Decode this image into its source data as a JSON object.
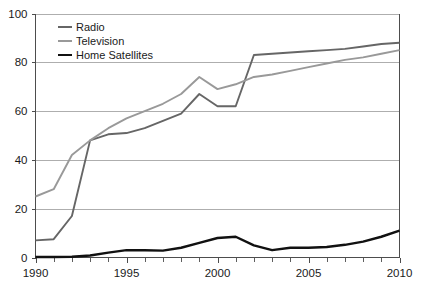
{
  "chart_data": {
    "type": "line",
    "title": "",
    "subtitle": "",
    "xlabel": "",
    "ylabel": "",
    "xlim": [
      1990,
      2010
    ],
    "ylim": [
      0,
      100
    ],
    "grid": true,
    "grid_axis": "y",
    "legend_position": "top-left",
    "x": [
      1990,
      1991,
      1992,
      1993,
      1994,
      1995,
      1996,
      1997,
      1998,
      1999,
      2000,
      2001,
      2002,
      2003,
      2004,
      2005,
      2006,
      2007,
      2008,
      2009,
      2010
    ],
    "xticks": [
      1990,
      1995,
      2000,
      2005,
      2010
    ],
    "xtick_labels": [
      "1990",
      "1995",
      "2000",
      "2005",
      "2010"
    ],
    "xminor_ticks": [
      1990,
      1991,
      1992,
      1993,
      1994,
      1995,
      1996,
      1997,
      1998,
      1999,
      2000,
      2001,
      2002,
      2003,
      2004,
      2005,
      2006,
      2007,
      2008,
      2009,
      2010
    ],
    "yticks": [
      0,
      20,
      40,
      60,
      80,
      100
    ],
    "ytick_labels": [
      "0",
      "20",
      "40",
      "60",
      "80",
      "100"
    ],
    "series": [
      {
        "name": "Radio",
        "color": "#666666",
        "width": 1.9,
        "values": [
          7,
          7.5,
          17,
          48,
          50.5,
          51,
          53,
          56,
          59,
          67,
          62,
          62,
          83,
          83.5,
          84,
          84.5,
          85,
          85.5,
          86.5,
          87.5,
          88
        ]
      },
      {
        "name": "Television",
        "color": "#999999",
        "width": 1.9,
        "values": [
          25,
          28,
          42,
          48,
          53,
          57,
          60,
          63,
          67,
          74,
          69,
          71,
          74,
          75,
          76.5,
          78,
          79.5,
          81,
          82,
          83.5,
          85
        ]
      },
      {
        "name": "Home Satellites",
        "color": "#111111",
        "width": 2.4,
        "values": [
          0.2,
          0.2,
          0.3,
          0.8,
          2,
          3,
          3,
          2.8,
          4,
          6,
          8,
          8.5,
          5,
          3,
          4,
          4,
          4.3,
          5.2,
          6.5,
          8.5,
          11
        ]
      }
    ],
    "legend": [
      {
        "label": "Radio",
        "color": "#666666",
        "width": 2.1
      },
      {
        "label": "Television",
        "color": "#999999",
        "width": 2.1
      },
      {
        "label": "Home Satellites",
        "color": "#111111",
        "width": 2.6
      }
    ]
  },
  "axes": {
    "frame_color": "#4d4d4d",
    "grid_color": "#9a9a9a",
    "background": "#ffffff"
  }
}
